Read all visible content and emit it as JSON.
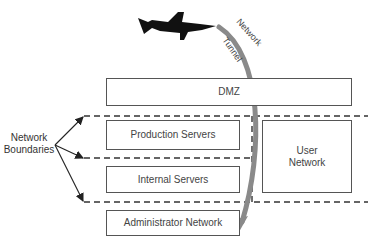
{
  "diagram": {
    "boxes": {
      "dmz": "DMZ",
      "production": "Production Servers",
      "internal": "Internal Servers",
      "user_line1": "User",
      "user_line2": "Network",
      "admin": "Administrator Network"
    },
    "labels": {
      "boundaries_line1": "Network",
      "boundaries_line2": "Boundaries",
      "tunnel_word1": "Network",
      "tunnel_word2": "Tunnel"
    },
    "icons": {
      "attacker": "shark-icon"
    },
    "colors": {
      "tunnel_arrow": "#8a8a8a",
      "box_border": "#555555",
      "boundary_line": "#333333",
      "shark": "#111111"
    }
  }
}
